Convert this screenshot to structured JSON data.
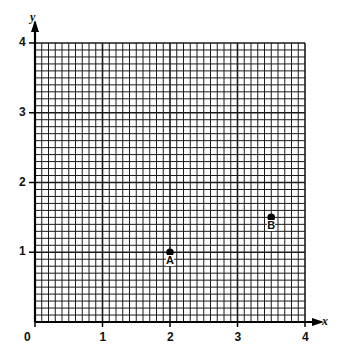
{
  "chart_data": {
    "type": "scatter",
    "title": "",
    "xlabel": "x",
    "ylabel": "y",
    "xlim": [
      0,
      4
    ],
    "ylim": [
      0,
      4
    ],
    "x_ticks": [
      "0",
      "1",
      "2",
      "3",
      "4"
    ],
    "y_ticks": [
      "1",
      "2",
      "3",
      "4"
    ],
    "grid": true,
    "grid_minor_per_unit": 10,
    "points": [
      {
        "label": "A",
        "x": 2,
        "y": 1
      },
      {
        "label": "B",
        "x": 3.5,
        "y": 1.5
      }
    ]
  },
  "colors": {
    "grid": "#1a1a1a",
    "background": "#ffffff",
    "point": "#000000"
  }
}
